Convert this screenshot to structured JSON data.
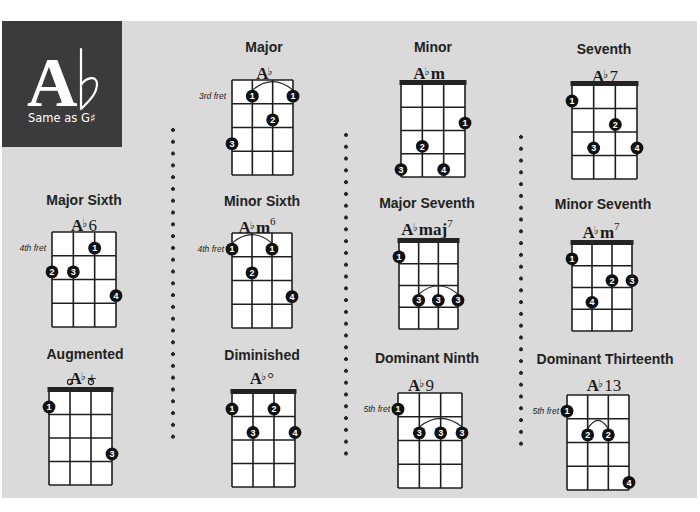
{
  "header": {
    "root": "A",
    "accidental": "♭",
    "subtitle": "Same as G♯"
  },
  "chords": [
    {
      "title": "Major",
      "name": {
        "root": "A",
        "accidental": "♭",
        "suffix": "",
        "ext": "",
        "sup": ""
      },
      "diagram": {
        "nut": false,
        "fret_label": "3rd fret",
        "open_strings": [],
        "fingers": [
          {
            "string": 1,
            "fret": 3,
            "finger": "3"
          },
          {
            "string": 2,
            "fret": 1,
            "finger": "1"
          },
          {
            "string": 3,
            "fret": 2,
            "finger": "2"
          },
          {
            "string": 4,
            "fret": 1,
            "finger": "1"
          }
        ],
        "barres": [
          {
            "from": 2,
            "to": 4,
            "fret": 1
          }
        ]
      }
    },
    {
      "title": "Minor",
      "name": {
        "root": "A",
        "accidental": "♭",
        "suffix": "m",
        "ext": "",
        "sup": ""
      },
      "diagram": {
        "nut": true,
        "fret_label": "",
        "open_strings": [],
        "fingers": [
          {
            "string": 4,
            "fret": 2,
            "finger": "1"
          },
          {
            "string": 2,
            "fret": 3,
            "finger": "2"
          },
          {
            "string": 1,
            "fret": 4,
            "finger": "3"
          },
          {
            "string": 3,
            "fret": 4,
            "finger": "4"
          }
        ],
        "barres": []
      }
    },
    {
      "title": "Seventh",
      "name": {
        "root": "A",
        "accidental": "♭",
        "suffix": "",
        "ext": "7",
        "sup": ""
      },
      "diagram": {
        "nut": true,
        "fret_label": "",
        "open_strings": [],
        "fingers": [
          {
            "string": 1,
            "fret": 1,
            "finger": "1"
          },
          {
            "string": 3,
            "fret": 2,
            "finger": "2"
          },
          {
            "string": 2,
            "fret": 3,
            "finger": "3"
          },
          {
            "string": 4,
            "fret": 3,
            "finger": "4"
          }
        ],
        "barres": []
      }
    },
    {
      "title": "Major Sixth",
      "name": {
        "root": "A",
        "accidental": "♭",
        "suffix": "",
        "ext": "6",
        "sup": ""
      },
      "diagram": {
        "nut": false,
        "fret_label": "4th fret",
        "open_strings": [],
        "fingers": [
          {
            "string": 3,
            "fret": 1,
            "finger": "1"
          },
          {
            "string": 1,
            "fret": 2,
            "finger": "2"
          },
          {
            "string": 2,
            "fret": 2,
            "finger": "3"
          },
          {
            "string": 4,
            "fret": 3,
            "finger": "4"
          }
        ],
        "barres": []
      }
    },
    {
      "title": "Minor Sixth",
      "name": {
        "root": "A",
        "accidental": "♭",
        "suffix": "m",
        "ext": "",
        "sup": "6"
      },
      "diagram": {
        "nut": false,
        "fret_label": "4th fret",
        "open_strings": [],
        "fingers": [
          {
            "string": 1,
            "fret": 1,
            "finger": "1"
          },
          {
            "string": 3,
            "fret": 1,
            "finger": "1"
          },
          {
            "string": 2,
            "fret": 2,
            "finger": "2"
          },
          {
            "string": 4,
            "fret": 3,
            "finger": "4"
          }
        ],
        "barres": [
          {
            "from": 1,
            "to": 3,
            "fret": 1
          }
        ]
      }
    },
    {
      "title": "Major Seventh",
      "name": {
        "root": "A",
        "accidental": "♭",
        "suffix": "maj",
        "ext": "",
        "sup": "7"
      },
      "diagram": {
        "nut": true,
        "fret_label": "",
        "open_strings": [],
        "fingers": [
          {
            "string": 1,
            "fret": 1,
            "finger": "1"
          },
          {
            "string": 2,
            "fret": 3,
            "finger": "3"
          },
          {
            "string": 3,
            "fret": 3,
            "finger": "3"
          },
          {
            "string": 4,
            "fret": 3,
            "finger": "3"
          }
        ],
        "barres": [
          {
            "from": 2,
            "to": 4,
            "fret": 3
          }
        ]
      }
    },
    {
      "title": "Minor Seventh",
      "name": {
        "root": "A",
        "accidental": "♭",
        "suffix": "m",
        "ext": "",
        "sup": "7"
      },
      "diagram": {
        "nut": true,
        "fret_label": "",
        "open_strings": [],
        "fingers": [
          {
            "string": 1,
            "fret": 1,
            "finger": "1"
          },
          {
            "string": 3,
            "fret": 2,
            "finger": "2"
          },
          {
            "string": 4,
            "fret": 2,
            "finger": "3"
          },
          {
            "string": 2,
            "fret": 3,
            "finger": "4"
          }
        ],
        "barres": []
      }
    },
    {
      "title": "Augmented",
      "name": {
        "root": "A",
        "accidental": "♭",
        "suffix": "",
        "ext": "+",
        "sup": ""
      },
      "diagram": {
        "nut": true,
        "fret_label": "",
        "open_strings": [
          2,
          3
        ],
        "fingers": [
          {
            "string": 1,
            "fret": 1,
            "finger": "1"
          },
          {
            "string": 4,
            "fret": 3,
            "finger": "3"
          }
        ],
        "barres": []
      }
    },
    {
      "title": "Diminished",
      "name": {
        "root": "A",
        "accidental": "♭",
        "suffix": "",
        "ext": "°",
        "sup": ""
      },
      "diagram": {
        "nut": true,
        "fret_label": "",
        "open_strings": [],
        "fingers": [
          {
            "string": 1,
            "fret": 1,
            "finger": "1"
          },
          {
            "string": 3,
            "fret": 1,
            "finger": "2"
          },
          {
            "string": 2,
            "fret": 2,
            "finger": "3"
          },
          {
            "string": 4,
            "fret": 2,
            "finger": "4"
          }
        ],
        "barres": []
      }
    },
    {
      "title": "Dominant Ninth",
      "name": {
        "root": "A",
        "accidental": "♭",
        "suffix": "",
        "ext": "9",
        "sup": ""
      },
      "diagram": {
        "nut": false,
        "fret_label": "5th fret",
        "open_strings": [],
        "fingers": [
          {
            "string": 1,
            "fret": 1,
            "finger": "1"
          },
          {
            "string": 2,
            "fret": 2,
            "finger": "3"
          },
          {
            "string": 3,
            "fret": 2,
            "finger": "3"
          },
          {
            "string": 4,
            "fret": 2,
            "finger": "3"
          }
        ],
        "barres": [
          {
            "from": 2,
            "to": 4,
            "fret": 2
          }
        ]
      }
    },
    {
      "title": "Dominant Thirteenth",
      "name": {
        "root": "A",
        "accidental": "♭",
        "suffix": "",
        "ext": "13",
        "sup": ""
      },
      "diagram": {
        "nut": false,
        "fret_label": "5th fret",
        "open_strings": [],
        "fingers": [
          {
            "string": 1,
            "fret": 1,
            "finger": "1"
          },
          {
            "string": 2,
            "fret": 2,
            "finger": "2"
          },
          {
            "string": 3,
            "fret": 2,
            "finger": "2"
          },
          {
            "string": 4,
            "fret": 4,
            "finger": "4"
          }
        ],
        "barres": [
          {
            "from": 2,
            "to": 3,
            "fret": 2
          }
        ]
      }
    }
  ]
}
